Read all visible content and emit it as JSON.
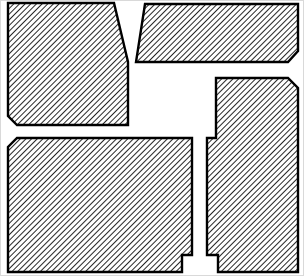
{
  "figure": {
    "colors": {
      "outline": "#000000",
      "hatch": "#000000",
      "background": "#ffffff",
      "frame": "#d9d9d9"
    },
    "fill_pattern": "diagonal-hatch",
    "panels": [
      {
        "id": "top-left",
        "label": "Top-left panel (beveled lower-left corner, slanted right edge)"
      },
      {
        "id": "top-right",
        "label": "Top-right panel (slanted left edge, beveled lower-right corner)"
      },
      {
        "id": "right-tall",
        "label": "Right tall panel (beveled upper-right corner, notched left edge)"
      },
      {
        "id": "bottom-left",
        "label": "Bottom-left panel (beveled upper-left corner, notched lower-right)"
      }
    ]
  }
}
